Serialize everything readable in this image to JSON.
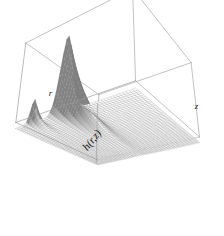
{
  "figure": {
    "kind": "perspective-surface-plot",
    "background_color": "#ffffff",
    "line_color": "#555555",
    "frame_color": "#9a9a9a",
    "mesh_color": "#6e6e6e",
    "fill_light": "#f2f2f2",
    "fill_dark": "#9c9c9c",
    "label_color": "#1a1a1a"
  },
  "axes": {
    "z_label": "h(r,z)",
    "x_label": "r",
    "y_label": "z",
    "z_label_rotation_deg": -52,
    "x_label_rotation_deg": 0,
    "y_label_rotation_deg": 0,
    "box_visible": true,
    "ticks_visible": false,
    "tick_labels_visible": false
  },
  "chart_data": {
    "type": "surface",
    "title": "",
    "subtitle": "",
    "xlabel": "r",
    "ylabel": "z",
    "zlabel": "h(r,z)",
    "colormap": "grayscale",
    "grid": true,
    "legend": false,
    "legend_position": "none",
    "shading": "monochrome-wireframe",
    "xlim": [
      0,
      1
    ],
    "ylim": [
      0,
      1
    ],
    "zlim": [
      0,
      1
    ],
    "nx": 46,
    "ny": 46,
    "view": {
      "theta_deg": 34,
      "phi_deg": 24,
      "perspective_d": 2.6
    },
    "surface_model": {
      "description": "Tall narrow ridge running along z near r=0.46 that decays toward large z, plus a smaller secondary ridge near r=0.18 at small z, on a flat near-zero base.",
      "components": [
        {
          "name": "main-ridge",
          "peak_height": 1.0,
          "r_center": 0.46,
          "r_width": 0.052,
          "z_decay": 5.2,
          "z_onset": 0.0
        },
        {
          "name": "secondary-ridge",
          "peak_height": 0.3,
          "r_center": 0.175,
          "r_width": 0.03,
          "z_decay": 16.0,
          "z_onset": 0.0
        }
      ],
      "base_level": 0.0
    },
    "x": [
      0.0,
      0.0222,
      0.0444,
      0.0667,
      0.0889,
      0.1111,
      0.1333,
      0.1556,
      0.1778,
      0.2,
      0.2222,
      0.2444,
      0.2667,
      0.2889,
      0.3111,
      0.3333,
      0.3556,
      0.3778,
      0.4,
      0.4222,
      0.4444,
      0.4667,
      0.4889,
      0.5111,
      0.5333,
      0.5556,
      0.5778,
      0.6,
      0.6222,
      0.6444,
      0.6667,
      0.6889,
      0.7111,
      0.7333,
      0.7556,
      0.7778,
      0.8,
      0.8222,
      0.8444,
      0.8667,
      0.8889,
      0.9111,
      0.9333,
      0.9556,
      0.9778,
      1.0
    ],
    "y": [
      0.0,
      0.0222,
      0.0444,
      0.0667,
      0.0889,
      0.1111,
      0.1333,
      0.1556,
      0.1778,
      0.2,
      0.2222,
      0.2444,
      0.2667,
      0.2889,
      0.3111,
      0.3333,
      0.3556,
      0.3778,
      0.4,
      0.4222,
      0.4444,
      0.4667,
      0.4889,
      0.5111,
      0.5333,
      0.5556,
      0.5778,
      0.6,
      0.6222,
      0.6444,
      0.6667,
      0.6889,
      0.7111,
      0.7333,
      0.7556,
      0.7778,
      0.8,
      0.8222,
      0.8444,
      0.8667,
      0.8889,
      0.9111,
      0.9333,
      0.9556,
      0.9778,
      1.0
    ],
    "peak_value": 1.0,
    "peak_location": {
      "r": 0.46,
      "z": 0.0
    },
    "secondary_peak_value": 0.3,
    "secondary_peak_location": {
      "r": 0.175,
      "z": 0.0
    }
  }
}
